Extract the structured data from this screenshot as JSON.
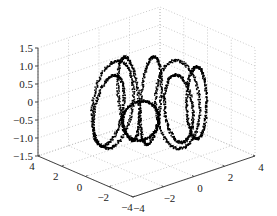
{
  "chart_data": {
    "type": "scatter",
    "dimensions": 3,
    "title": "",
    "xlabel": "",
    "ylabel": "",
    "zlabel": "",
    "xlim": [
      -4,
      4
    ],
    "ylim": [
      -4,
      4
    ],
    "zlim": [
      -1.5,
      1.5
    ],
    "grid": true,
    "legend": null,
    "x_ticks": [
      "4",
      "2",
      "0",
      "−2",
      "−4"
    ],
    "y_ticks": [
      "−4",
      "−2",
      "0",
      "2",
      "4"
    ],
    "z_ticks": [
      "1.5",
      "1.0",
      "0.5",
      "0",
      "−0.5",
      "−1.0",
      "−1.5"
    ],
    "marker": "dot",
    "marker_color": "#000000",
    "loops": [
      {
        "cx": 112,
        "cy": 104,
        "rx": 20,
        "ry": 44,
        "tilt": 0.15
      },
      {
        "cx": 108,
        "cy": 110,
        "rx": 14,
        "ry": 36,
        "tilt": 0.2
      },
      {
        "cx": 128,
        "cy": 98,
        "rx": 10,
        "ry": 42,
        "tilt": -0.1
      },
      {
        "cx": 150,
        "cy": 100,
        "rx": 10,
        "ry": 44,
        "tilt": 0.08
      },
      {
        "cx": 177,
        "cy": 104,
        "rx": 22,
        "ry": 44,
        "tilt": -0.05
      },
      {
        "cx": 178,
        "cy": 108,
        "rx": 14,
        "ry": 34,
        "tilt": -0.1
      },
      {
        "cx": 196,
        "cy": 102,
        "rx": 10,
        "ry": 36,
        "tilt": 0.0
      },
      {
        "cx": 140,
        "cy": 120,
        "rx": 18,
        "ry": 20,
        "tilt": 0.4
      }
    ]
  }
}
